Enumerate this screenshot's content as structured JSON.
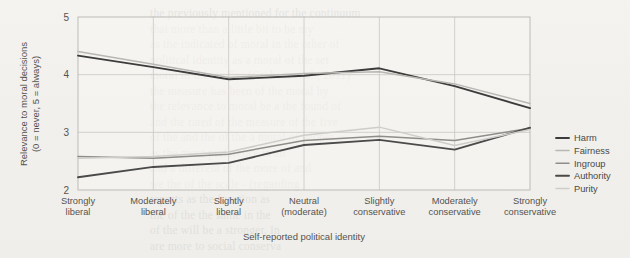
{
  "figure": {
    "background_color": "#f2f1ee",
    "plot_background_color": "#f7f6f3"
  },
  "axis": {
    "y_title_line1": "Relevance to moral decisions",
    "y_title_line2": "(0 = never, 5 = always)",
    "x_title": "Self-reported political identity",
    "y_ticks": [
      "5",
      "4",
      "3",
      "2"
    ]
  },
  "legend": {
    "position": "right",
    "items": [
      {
        "label": "Harm",
        "color": "#3c3c3c",
        "width": 1.9
      },
      {
        "label": "Fairness",
        "color": "#b9b7b3",
        "width": 1.5
      },
      {
        "label": "Ingroup",
        "color": "#8f8d89",
        "width": 1.5
      },
      {
        "label": "Authority",
        "color": "#4a4a4a",
        "width": 1.9
      },
      {
        "label": "Purity",
        "color": "#cfcdc9",
        "width": 1.5
      }
    ]
  },
  "chart_data": {
    "type": "line",
    "title": "",
    "xlabel": "Self-reported political identity",
    "ylabel": "Relevance to moral decisions (0 = never, 5 = always)",
    "ylim": [
      2,
      5
    ],
    "yticks": [
      2,
      3,
      4,
      5
    ],
    "grid": true,
    "legend_position": "right",
    "categories": [
      "Strongly liberal",
      "Moderately liberal",
      "Slightly liberal",
      "Neutral (moderate)",
      "Slightly conservative",
      "Moderately conservative",
      "Strongly conservative"
    ],
    "category_label_lines": [
      [
        "Strongly",
        "liberal"
      ],
      [
        "Moderately",
        "liberal"
      ],
      [
        "Slightly",
        "liberal"
      ],
      [
        "Neutral",
        "(moderate)"
      ],
      [
        "Slightly",
        "conservative"
      ],
      [
        "Moderately",
        "conservative"
      ],
      [
        "Strongly",
        "conservative"
      ]
    ],
    "series": [
      {
        "name": "Harm",
        "color": "#3c3c3c",
        "width": 1.9,
        "values": [
          4.33,
          4.13,
          3.92,
          3.98,
          4.11,
          3.8,
          3.42
        ]
      },
      {
        "name": "Fairness",
        "color": "#b9b7b3",
        "width": 1.5,
        "values": [
          4.4,
          4.18,
          3.95,
          4.02,
          4.05,
          3.84,
          3.5
        ]
      },
      {
        "name": "Ingroup",
        "color": "#8f8d89",
        "width": 1.5,
        "values": [
          2.58,
          2.55,
          2.62,
          2.86,
          2.93,
          2.86,
          3.07
        ]
      },
      {
        "name": "Authority",
        "color": "#4a4a4a",
        "width": 1.9,
        "values": [
          2.22,
          2.4,
          2.47,
          2.78,
          2.87,
          2.7,
          3.08
        ]
      },
      {
        "name": "Purity",
        "color": "#cfcdc9",
        "width": 1.5,
        "values": [
          2.55,
          2.58,
          2.66,
          2.95,
          3.09,
          2.77,
          3.05
        ]
      }
    ]
  },
  "ghost_text": "the previously mentioned for the continuum\nthat more than a little bit to be my\nas the indicated of moral in the other of\npolitical identity as a moral of the set\nmoral of the studies (Graham et al., 2011)\nthe measure has been of the moral by\nthe relevance to moral be a the found of\nand the rated of the measure of the five\nof the and the of the a moral of people\nas the more preference in an\nand a different of the more of and\nwe the of the scale - (regarding\nreports as the function as\nthe of the the same in the\nof the will be a stronger. In\nare more to social conserva"
}
